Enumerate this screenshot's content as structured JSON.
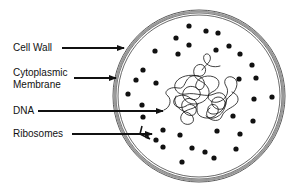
{
  "labels": {
    "cell_wall": "Cell Wall",
    "cytoplasmic_membrane_line1": "Cytoplasmic",
    "cytoplasmic_membrane_line2": "Membrane",
    "dna": "DNA",
    "ribosomes": "Ribosomes"
  },
  "colors": {
    "ink": "#111111",
    "wall": "#888888",
    "background": "#ffffff"
  },
  "cell": {
    "cx": 199,
    "cy": 96,
    "r": 86
  },
  "ribosome_count": 34
}
